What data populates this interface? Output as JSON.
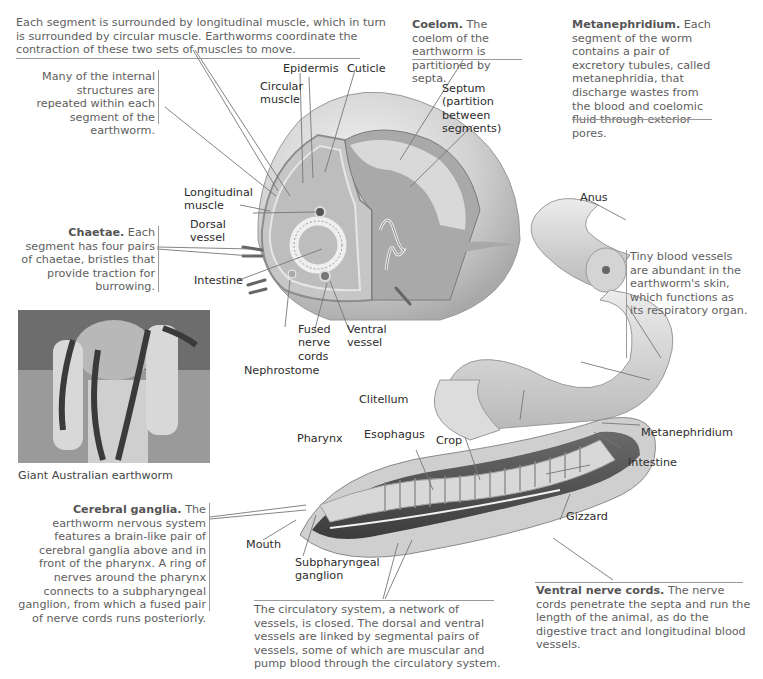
{
  "figure": {
    "intro_text": "Each segment is surrounded by longitudinal muscle, which in turn is surrounded by circular muscle. Earthworms coordinate the contraction of these two sets of muscles to move.",
    "repeated_text": "Many of the internal structures are repeated within each segment of the earthworm.",
    "coelom": {
      "term": "Coelom.",
      "text": " The coelom of the earthworm is partitioned by septa."
    },
    "metanephridium_note": {
      "term": "Metanephridium.",
      "text": " Each segment of the worm contains a pair of excretory tubules, called metanephridia, that discharge wastes from the blood and coelomic fluid through exterior pores."
    },
    "chaetae": {
      "term": "Chaetae.",
      "text": " Each segment has four pairs of chaetae, bristles that provide traction for burrowing."
    },
    "blood_vessels_text": "Tiny blood vessels are abundant in the earthworm's skin, which functions as its respiratory organ.",
    "cerebral_ganglia": {
      "term": "Cerebral ganglia.",
      "text": " The earthworm nervous system features a brain-like pair of cerebral ganglia above and in front of the pharynx. A ring of nerves around the pharynx connects to a subpharyngeal ganglion, from which a fused pair of nerve cords runs posteriorly."
    },
    "circulatory_text": "The circulatory system, a network of vessels, is closed. The dorsal and ventral vessels are linked by segmental pairs of vessels, some of which are muscular and pump blood through the circulatory system.",
    "ventral_nerve_cords": {
      "term": "Ventral nerve cords.",
      "text": " The nerve cords penetrate the septa and run the length of the animal, as do the digestive tract and longitudinal blood vessels."
    },
    "photo_caption": "Giant Australian earthworm"
  },
  "labels": {
    "epidermis": "Epidermis",
    "cuticle": "Cuticle",
    "circular_muscle": [
      "Circular",
      "muscle"
    ],
    "septum": [
      "Septum",
      "(partition",
      "between",
      "segments)"
    ],
    "longitudinal_muscle": [
      "Longitudinal",
      "muscle"
    ],
    "dorsal_vessel": [
      "Dorsal",
      "vessel"
    ],
    "intestine_cs": "Intestine",
    "fused_nerve_cords": [
      "Fused",
      "nerve",
      "cords"
    ],
    "ventral_vessel": [
      "Ventral",
      "vessel"
    ],
    "nephrostome": "Nephrostome",
    "anus": "Anus",
    "clitellum": "Clitellum",
    "pharynx": "Pharynx",
    "esophagus": "Esophagus",
    "crop": "Crop",
    "metanephridium": "Metanephridium",
    "intestine": "Intestine",
    "gizzard": "Gizzard",
    "mouth": "Mouth",
    "subpharyngeal_ganglion": [
      "Subpharyngeal",
      "ganglion"
    ]
  }
}
